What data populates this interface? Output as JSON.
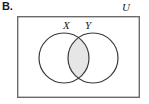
{
  "figure": {
    "part_label": "B.",
    "universe_label": "U",
    "type": "venn-diagram",
    "colors": {
      "stroke": "#3a3a3a",
      "frame_stroke": "#6b6b6b",
      "shade_fill": "#e6e6e6",
      "circle_fill": "#ffffff",
      "background": "#ffffff",
      "text": "#1b1b1b"
    },
    "frame": {
      "name": "universal-set-rectangle",
      "x": 17,
      "y": 16,
      "width": 123,
      "height": 82,
      "stroke_width": 1.4
    },
    "sets": [
      {
        "label": "X",
        "name": "set-x",
        "cx": 64,
        "cy": 58,
        "r": 25,
        "label_x": 63,
        "label_y": 19
      },
      {
        "label": "Y",
        "name": "set-y",
        "cx": 93,
        "cy": 58,
        "r": 25,
        "label_x": 85,
        "label_y": 19
      }
    ],
    "shaded_region": {
      "name": "intersection-lens",
      "meaning": "X intersect Y",
      "fill": "#e6e6e6"
    }
  }
}
